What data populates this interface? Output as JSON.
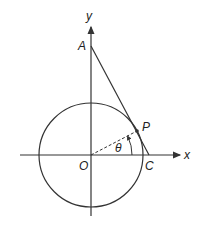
{
  "diagram": {
    "type": "geometry",
    "labels": {
      "y_axis": "y",
      "x_axis": "x",
      "point_A": "A",
      "point_P": "P",
      "point_O": "O",
      "point_C": "C",
      "angle": "θ"
    },
    "colors": {
      "stroke": "#333333",
      "background": "#ffffff"
    }
  }
}
